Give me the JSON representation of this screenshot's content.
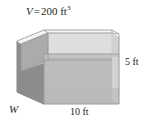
{
  "figure": {
    "type": "geometry-diagram",
    "shape": "open-top-rectangular-box",
    "labels": {
      "volume_variable": "V",
      "volume_equals": "=",
      "volume_value": "200 ft",
      "volume_exponent": "3",
      "volume_full": "V = 200 ft3",
      "width": "W",
      "length": "10 ft",
      "height": "5 ft"
    },
    "colors": {
      "background": "#ffffff",
      "text": "#231f20",
      "top_rim": "#f2f2f2",
      "inner_back": "#dcdcdc",
      "inner_floor": "#c9c9c9",
      "front_face": "#bdbdbd",
      "left_face": "#8f8f8f",
      "left_inner": "#a8a8a8",
      "edge_line": "#9a9a9a"
    }
  }
}
